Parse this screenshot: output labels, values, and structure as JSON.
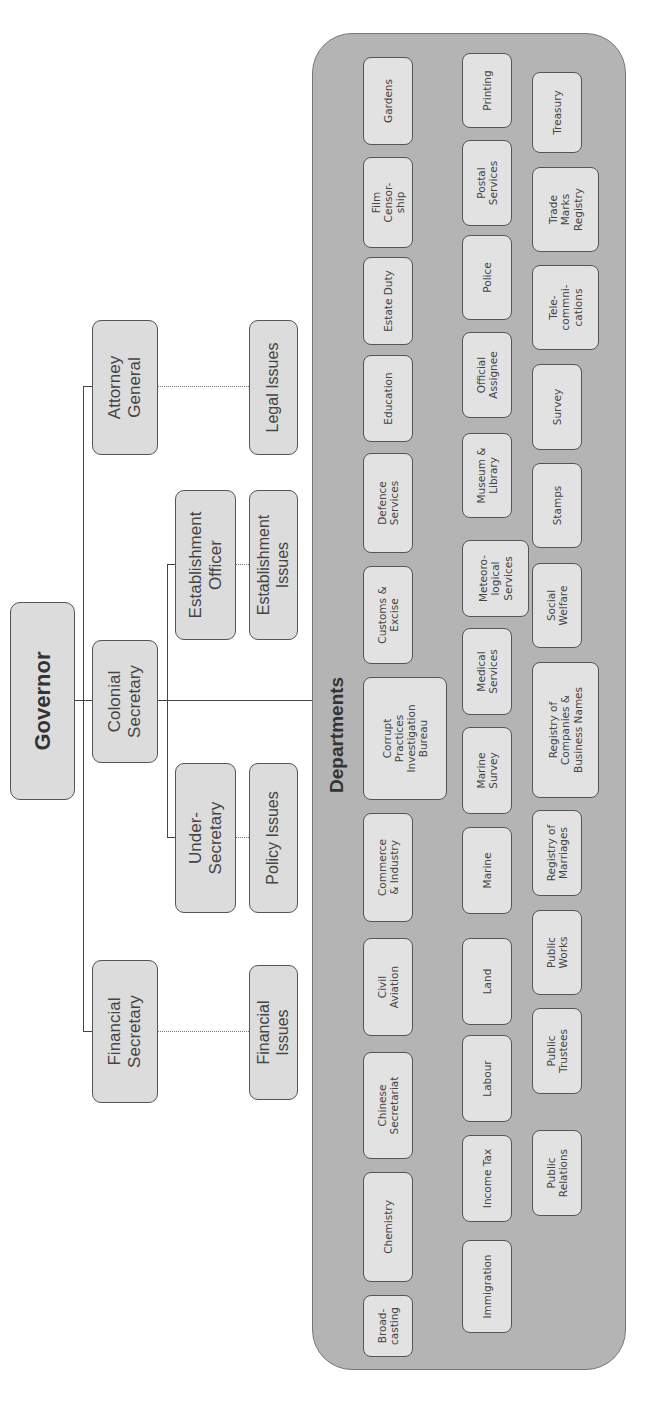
{
  "top": {
    "governor": "Governor",
    "attorney_general": "Attorney\nGeneral",
    "colonial_secretary": "Colonial\nSecretary",
    "financial_secretary": "Financial\nSecretary",
    "establishment_officer": "Establishment\nOfficer",
    "under_secretary": "Under-\nSecretary"
  },
  "issues": {
    "legal": "Legal Issues",
    "establishment": "Establishment\nIssues",
    "policy": "Policy Issues",
    "financial": "Financial\nIssues"
  },
  "departments": {
    "title": "Departments",
    "row1": [
      "Broad-\ncasting",
      "Chemistry",
      "Chinese\nSecretariat",
      "Civil\nAviation",
      "Commerce\n& Industry",
      "Corrupt\nPractices\nInvestigation\nBureau",
      "Customs &\nExcise",
      "Defence\nServices",
      "Education",
      "Estate Duty",
      "Film\nCensor-\nship",
      "Gardens"
    ],
    "row2": [
      "Immigration",
      "Income Tax",
      "Labour",
      "Land",
      "Marine",
      "Marine\nSurvey",
      "Medical\nServices",
      "Meteoro-\nlogical\nServices",
      "Museum &\nLibrary",
      "Official\nAssignee",
      "Police",
      "Postal\nServices",
      "Printing"
    ],
    "row3": [
      "Public\nRelations",
      "Public\nTrustees",
      "Public\nWorks",
      "Registry of\nMarriages",
      "Registry of\nCompanies &\nBusiness Names",
      "Social\nWelfare",
      "Stamps",
      "Survey",
      "Tele-\ncommni-\ncations",
      "Trade\nMarks\nRegistry",
      "Treasury"
    ]
  },
  "colors": {
    "box_fill": "#dcdcdc",
    "container_fill": "#b4b4b4",
    "border": "#555555"
  }
}
